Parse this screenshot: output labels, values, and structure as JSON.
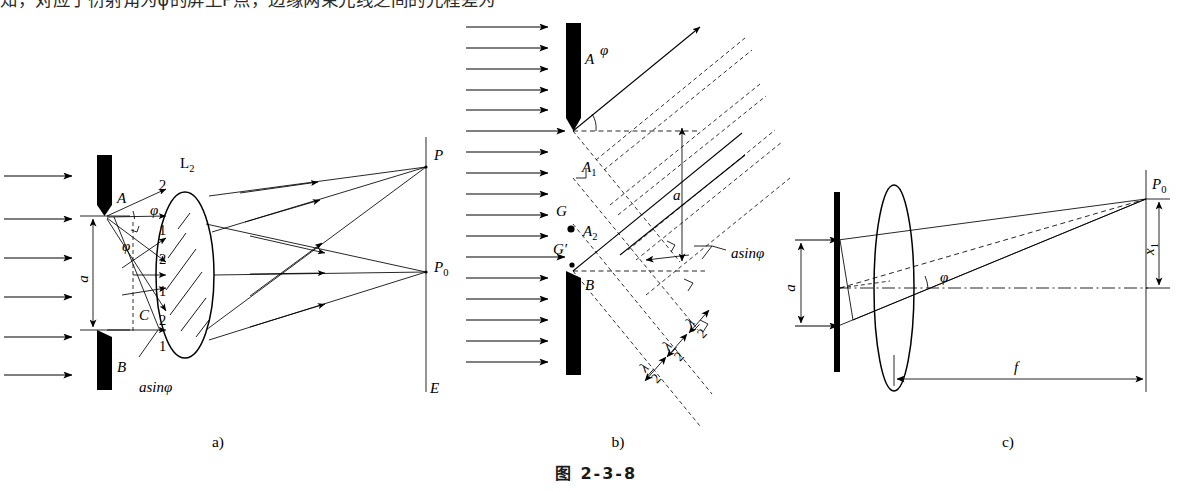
{
  "page": {
    "top_text_line": "知，对应于衍射角为φ的屏上P点，边缘两束光线之间的光程差为",
    "figure_number": "图  2-3-8"
  },
  "captions": {
    "a": "a)",
    "b": "b)",
    "c": "c)"
  },
  "panel_a": {
    "name": "single-slit-ray-diagram",
    "labels": {
      "slit_top": "A",
      "slit_center": "C",
      "slit_bottom": "B",
      "slit_width": "a",
      "angle": "φ",
      "lens": "L",
      "lens_sub": "2",
      "path_difference": "asinφ",
      "screen": "E",
      "point_p": "P",
      "point_p0": "P",
      "point_p0_sub": "0"
    },
    "ray_numbers": [
      "2",
      "1",
      "2",
      "1",
      "2",
      "1"
    ],
    "incoming_wave_arrows": 6
  },
  "panel_b": {
    "name": "half-wave-zone-construction",
    "labels": {
      "slit_top": "A",
      "zone_1": "A",
      "zone_1_sub": "1",
      "zone_2": "A",
      "zone_2_sub": "2",
      "point_g": "G",
      "point_g_prime": "G′",
      "slit_bottom": "B",
      "slit_width": "a",
      "angle": "φ",
      "path_difference": "asinφ"
    },
    "path_fractions": [
      {
        "num": "λ",
        "den": "2"
      },
      {
        "num": "λ",
        "den": "2"
      },
      {
        "num": "λ",
        "den": "2"
      }
    ],
    "incoming_wave_arrows": 14
  },
  "panel_c": {
    "name": "focal-geometry-diagram",
    "labels": {
      "slit_width": "a",
      "angle": "φ",
      "focal_length": "f",
      "screen_position": "x",
      "screen_position_sub": "1",
      "point_p0": "P",
      "point_p0_sub": "0"
    }
  },
  "colors": {
    "ink": "#000000",
    "paper": "#ffffff",
    "text_gray": "#2b2b2b"
  }
}
